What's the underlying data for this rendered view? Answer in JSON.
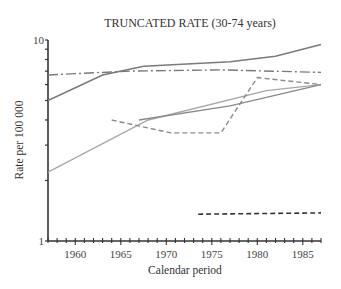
{
  "chart_data": {
    "type": "line",
    "title": "TRUNCATED RATE (30-74 years)",
    "xlabel": "Calendar period",
    "ylabel": "Rate per 100 000",
    "xlim": [
      1957,
      1987
    ],
    "ylim": [
      1,
      10
    ],
    "yscale": "log",
    "xticks": [
      1960,
      1965,
      1970,
      1975,
      1980,
      1985
    ],
    "yticks": [
      1,
      10
    ],
    "grid": false,
    "legend": null,
    "series": [
      {
        "name": "series-solid-dark-top",
        "style": "solid",
        "color": "#7a7a7a",
        "x": [
          1957,
          1963,
          1967.5,
          1977,
          1982,
          1987
        ],
        "values": [
          5.0,
          6.7,
          7.4,
          7.8,
          8.3,
          9.5
        ]
      },
      {
        "name": "series-dash-dot",
        "style": "dashdot",
        "color": "#7a7a7a",
        "x": [
          1957,
          1966,
          1976,
          1987
        ],
        "values": [
          6.7,
          7.0,
          7.1,
          6.9
        ]
      },
      {
        "name": "series-solid-light",
        "style": "solid",
        "color": "#a8a8a8",
        "x": [
          1957,
          1968,
          1981,
          1987
        ],
        "values": [
          2.2,
          4.0,
          5.6,
          6.0
        ]
      },
      {
        "name": "series-solid-mid",
        "style": "solid",
        "color": "#8a8a8a",
        "x": [
          1967,
          1977,
          1987
        ],
        "values": [
          4.0,
          4.7,
          6.0
        ]
      },
      {
        "name": "series-dashed-grey",
        "style": "dashed",
        "color": "#8a8a8a",
        "x": [
          1964,
          1970.5,
          1976,
          1980,
          1987
        ],
        "values": [
          4.0,
          3.45,
          3.45,
          6.5,
          6.0
        ]
      },
      {
        "name": "series-dashed-dark-bottom",
        "style": "dashed",
        "color": "#333333",
        "x": [
          1973.5,
          1987
        ],
        "values": [
          1.36,
          1.38
        ]
      }
    ]
  }
}
